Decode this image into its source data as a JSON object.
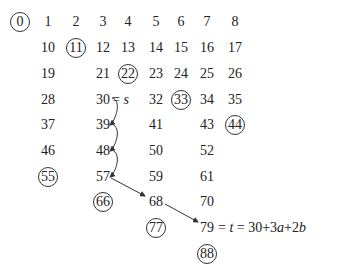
{
  "diagram": {
    "colors": {
      "text": "#222222",
      "circle": "#333333",
      "arrow": "#333333",
      "background": "#ffffff"
    },
    "grid": {
      "rows": [
        {
          "row": 0,
          "cells": [
            {
              "col": 0,
              "value": "0",
              "circled": true
            },
            {
              "col": 1,
              "value": "1"
            },
            {
              "col": 2,
              "value": "2"
            },
            {
              "col": 3,
              "value": "3"
            },
            {
              "col": 4,
              "value": "4"
            },
            {
              "col": 5,
              "value": "5"
            },
            {
              "col": 6,
              "value": "6"
            },
            {
              "col": 7,
              "value": "7"
            },
            {
              "col": 8,
              "value": "8"
            }
          ]
        },
        {
          "row": 1,
          "cells": [
            {
              "col": 1,
              "value": "10"
            },
            {
              "col": 2,
              "value": "11",
              "circled": true
            },
            {
              "col": 3,
              "value": "12"
            },
            {
              "col": 4,
              "value": "13"
            },
            {
              "col": 5,
              "value": "14"
            },
            {
              "col": 6,
              "value": "15"
            },
            {
              "col": 7,
              "value": "16"
            },
            {
              "col": 8,
              "value": "17"
            }
          ]
        },
        {
          "row": 2,
          "cells": [
            {
              "col": 1,
              "value": "19"
            },
            {
              "col": 3,
              "value": "21"
            },
            {
              "col": 4,
              "value": "22",
              "circled": true
            },
            {
              "col": 5,
              "value": "23"
            },
            {
              "col": 6,
              "value": "24"
            },
            {
              "col": 7,
              "value": "25"
            },
            {
              "col": 8,
              "value": "26"
            }
          ]
        },
        {
          "row": 3,
          "cells": [
            {
              "col": 1,
              "value": "28"
            },
            {
              "col": 3,
              "value": "30"
            },
            {
              "col": 5,
              "value": "32"
            },
            {
              "col": 6,
              "value": "33",
              "circled": true
            },
            {
              "col": 7,
              "value": "34"
            },
            {
              "col": 8,
              "value": "35"
            }
          ]
        },
        {
          "row": 4,
          "cells": [
            {
              "col": 1,
              "value": "37"
            },
            {
              "col": 3,
              "value": "39"
            },
            {
              "col": 5,
              "value": "41"
            },
            {
              "col": 7,
              "value": "43"
            },
            {
              "col": 8,
              "value": "44",
              "circled": true
            }
          ]
        },
        {
          "row": 5,
          "cells": [
            {
              "col": 1,
              "value": "46"
            },
            {
              "col": 3,
              "value": "48"
            },
            {
              "col": 5,
              "value": "50"
            },
            {
              "col": 7,
              "value": "52"
            }
          ]
        },
        {
          "row": 6,
          "cells": [
            {
              "col": 1,
              "value": "55",
              "circled": true
            },
            {
              "col": 3,
              "value": "57"
            },
            {
              "col": 5,
              "value": "59"
            },
            {
              "col": 7,
              "value": "61"
            }
          ]
        },
        {
          "row": 7,
          "cells": [
            {
              "col": 3,
              "value": "66",
              "circled": true
            },
            {
              "col": 5,
              "value": "68"
            },
            {
              "col": 7,
              "value": "70"
            }
          ]
        },
        {
          "row": 8,
          "cells": [
            {
              "col": 5,
              "value": "77",
              "circled": true
            },
            {
              "col": 7,
              "value": "79"
            }
          ]
        },
        {
          "row": 9,
          "cells": [
            {
              "col": 7,
              "value": "88",
              "circled": true
            }
          ]
        }
      ]
    },
    "labels": {
      "s_eq": "=",
      "s_var": "s",
      "t_eq1": "=",
      "t_var": "t",
      "t_eq2": "=",
      "t_expr_30": "30",
      "t_plus1": "+",
      "t_3": "3",
      "t_a": "a",
      "t_plus2": "+",
      "t_2": "2",
      "t_b": "b"
    },
    "path": [
      "30",
      "39",
      "48",
      "57",
      "68",
      "79"
    ]
  }
}
